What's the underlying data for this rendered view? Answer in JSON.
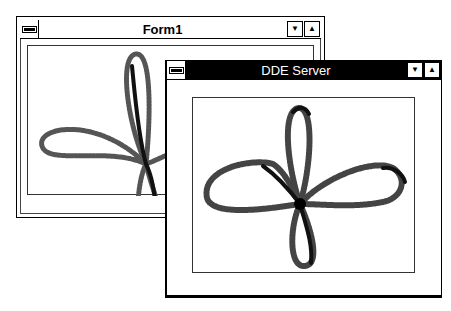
{
  "windows": [
    {
      "id": "form1",
      "title": "Form1",
      "active": false,
      "buttons": {
        "minimize": "▼",
        "maximize": "▲"
      }
    },
    {
      "id": "dde-server",
      "title": "DDE Server",
      "active": true,
      "buttons": {
        "minimize": "▼",
        "maximize": "▲"
      }
    }
  ],
  "drawing": {
    "shape": "four-lobed rose curve (clover)",
    "stroke": "#333333",
    "background": "#ffffff"
  }
}
